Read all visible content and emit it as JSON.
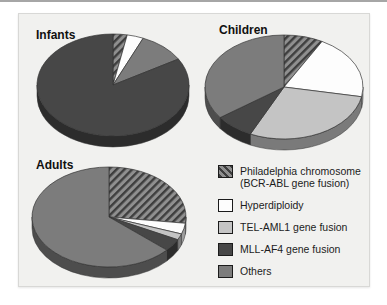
{
  "colors": {
    "page_bg": "#ffffff",
    "panel_bg": "#f1f1ef",
    "panel_border": "#d8d8d6",
    "top_rule": "#a6a6a6",
    "slice_stroke": "#333333",
    "ph_hatch_bg": "#8f8f8f",
    "ph_hatch_stripe": "#3e3e3e",
    "hyperdiploidy": "#fdfdfd",
    "tel_aml1": "#c4c4c4",
    "mll_af4": "#474747",
    "others": "#7c7c7c"
  },
  "chart_data": [
    {
      "type": "pie",
      "title": "Infants",
      "slices": [
        {
          "label": "Philadelphia chromosome (BCR-ABL gene fusion)",
          "swatch": "ph_hatch",
          "percent": 3
        },
        {
          "label": "Hyperdiploidy",
          "swatch": "hyperdiploidy",
          "percent": 3.5
        },
        {
          "label": "Others",
          "swatch": "others",
          "percent": 10
        },
        {
          "label": "MLL-AF4 gene fusion",
          "swatch": "mll_af4",
          "percent": 83.5
        }
      ]
    },
    {
      "type": "pie",
      "title": "Children",
      "slices": [
        {
          "label": "Philadelphia chromosome (BCR-ABL gene fusion)",
          "swatch": "ph_hatch",
          "percent": 8
        },
        {
          "label": "Hyperdiploidy",
          "swatch": "hyperdiploidy",
          "percent": 20
        },
        {
          "label": "TEL-AML1 gene fusion",
          "swatch": "tel_aml1",
          "percent": 29
        },
        {
          "label": "MLL-AF4 gene fusion",
          "swatch": "mll_af4",
          "percent": 8
        },
        {
          "label": "Others",
          "swatch": "others",
          "percent": 35
        }
      ]
    },
    {
      "type": "pie",
      "title": "Adults",
      "slices": [
        {
          "label": "Philadelphia chromosome (BCR-ABL gene fusion)",
          "swatch": "ph_hatch",
          "percent": 27
        },
        {
          "label": "Hyperdiploidy",
          "swatch": "hyperdiploidy",
          "percent": 3.5
        },
        {
          "label": "TEL-AML1 gene fusion",
          "swatch": "tel_aml1",
          "percent": 2
        },
        {
          "label": "MLL-AF4 gene fusion",
          "swatch": "mll_af4",
          "percent": 4
        },
        {
          "label": "Others",
          "swatch": "others",
          "percent": 63.5
        }
      ]
    }
  ],
  "legend": {
    "items": [
      {
        "label": "Philadelphia chromosome",
        "label2": "(BCR-ABL gene fusion)",
        "swatch": "ph_hatch"
      },
      {
        "label": "Hyperdiploidy",
        "swatch": "hyperdiploidy"
      },
      {
        "label": "TEL-AML1 gene fusion",
        "swatch": "tel_aml1"
      },
      {
        "label": "MLL-AF4 gene fusion",
        "swatch": "mll_af4"
      },
      {
        "label": "Others",
        "swatch": "others"
      }
    ]
  }
}
